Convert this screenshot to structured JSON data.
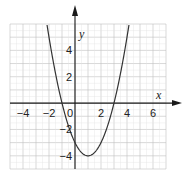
{
  "chart_data": {
    "type": "line",
    "title": "",
    "function": "y = x^2 - 2x - 3",
    "xlabel": "x",
    "ylabel": "y",
    "xlim": [
      -5,
      7
    ],
    "ylim": [
      -5,
      6
    ],
    "grid": true,
    "x_ticks": [
      "-4",
      "-2",
      "0",
      "2",
      "4",
      "6"
    ],
    "y_ticks": [
      "4",
      "2",
      "-2",
      "-4"
    ],
    "series": [
      {
        "name": "parabola",
        "x": [
          -2.2,
          -2,
          -1.5,
          -1,
          -0.5,
          0,
          0.5,
          1,
          1.5,
          2,
          2.5,
          3,
          3.5,
          4,
          4.2
        ],
        "y": [
          6.24,
          5,
          2.25,
          0,
          -1.75,
          -3,
          -3.75,
          -4,
          -3.75,
          -3,
          -1.75,
          0,
          2.25,
          5,
          6.24
        ]
      }
    ],
    "roots": [
      -1,
      3
    ],
    "vertex": [
      1,
      -4
    ],
    "y_intercept": -3
  },
  "labels": {
    "x_axis": "x",
    "y_axis": "y",
    "x_ticks": [
      {
        "v": -4,
        "t": "−4"
      },
      {
        "v": -2,
        "t": "−2"
      },
      {
        "v": 0,
        "t": "0"
      },
      {
        "v": 2,
        "t": "2"
      },
      {
        "v": 4,
        "t": "4"
      },
      {
        "v": 6,
        "t": "6"
      }
    ],
    "y_ticks": [
      {
        "v": 4,
        "t": "4"
      },
      {
        "v": 2,
        "t": "2"
      },
      {
        "v": -2,
        "t": "−2"
      },
      {
        "v": -4,
        "t": "−4"
      }
    ]
  },
  "colors": {
    "grid": "#bfbfbf",
    "axis": "#1a1a1a",
    "curve": "#333333"
  }
}
